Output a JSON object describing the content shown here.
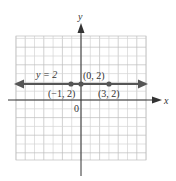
{
  "chart_data": {
    "type": "line",
    "title": "",
    "xlabel": "x",
    "ylabel": "y",
    "origin_label": "0",
    "xlim": [
      -7,
      7
    ],
    "ylim": [
      -7,
      7
    ],
    "grid": true,
    "series": [
      {
        "name": "y = 2",
        "equation": "y = 2",
        "kind": "horizontal line",
        "x": [
          -7,
          7
        ],
        "y": [
          2,
          2
        ]
      }
    ],
    "points": [
      {
        "x": -1,
        "y": 2,
        "label": "(−1, 2)"
      },
      {
        "x": 0,
        "y": 2,
        "label": "(0, 2)"
      },
      {
        "x": 3,
        "y": 2,
        "label": "(3, 2)"
      }
    ],
    "annotations": [
      "y = 2",
      "(0, 2)",
      "(−1, 2)",
      "(3, 2)",
      "0"
    ]
  },
  "labels": {
    "x_axis": "x",
    "y_axis": "y",
    "origin": "0",
    "line_label": "y = 2",
    "p_neg1": "(−1, 2)",
    "p_0": "(0, 2)",
    "p_3": "(3, 2)"
  },
  "colors": {
    "grid": "#d4d4d4",
    "grid_major": "#bdbdbd",
    "axis": "#333333",
    "line": "#555555",
    "point": "#555555"
  }
}
